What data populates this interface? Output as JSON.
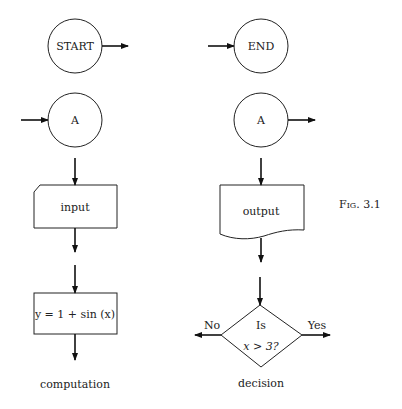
{
  "figure": {
    "caption": "Fig. 3.1",
    "symbols": {
      "start": {
        "label": "START"
      },
      "end": {
        "label": "END"
      },
      "connector_left": {
        "label": "A"
      },
      "connector_right": {
        "label": "A"
      },
      "input": {
        "label": "input"
      },
      "output": {
        "label": "output"
      },
      "computation": {
        "label": "y = 1 + sin (x)",
        "caption": "computation"
      },
      "decision": {
        "line1": "Is",
        "line2": "x > 3?",
        "no_label": "No",
        "yes_label": "Yes",
        "caption": "decision"
      }
    }
  }
}
